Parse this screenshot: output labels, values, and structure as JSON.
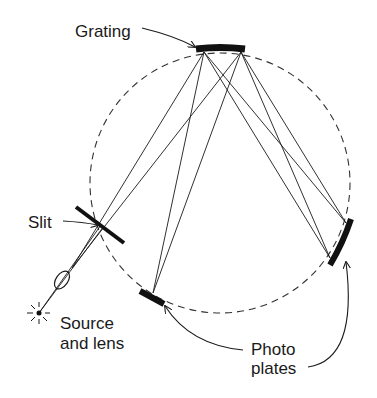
{
  "diagram": {
    "labels": {
      "grating": "Grating",
      "slit": "Slit",
      "source_line1": "Source",
      "source_line2": "and lens",
      "plates_line1": "Photo",
      "plates_line2": "plates"
    },
    "components": [
      {
        "id": "grating",
        "name": "Concave grating"
      },
      {
        "id": "slit",
        "name": "Slit"
      },
      {
        "id": "lens",
        "name": "Lens"
      },
      {
        "id": "source",
        "name": "Light source"
      },
      {
        "id": "plate-left",
        "name": "Photo plate (lower left)"
      },
      {
        "id": "plate-right",
        "name": "Photo plate (right)"
      },
      {
        "id": "rowland-circle",
        "name": "Rowland circle (dashed)"
      }
    ],
    "colors": {
      "ink": "#1a1a1a",
      "background": "#ffffff"
    }
  }
}
